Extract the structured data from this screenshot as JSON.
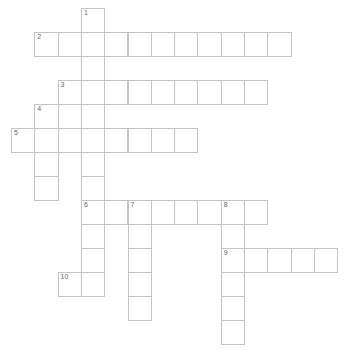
{
  "puzzle": {
    "cell_width": 23.3,
    "cell_height": 24,
    "origin_x": 11,
    "origin_y": 8,
    "colors": {
      "border": "#c4c4c4",
      "number": "#666666",
      "cell": "#ffffff"
    },
    "entries": [
      {
        "number": "1",
        "direction": "down",
        "row": 0,
        "col": 3,
        "length": 12
      },
      {
        "number": "2",
        "direction": "across",
        "row": 1,
        "col": 1,
        "length": 11
      },
      {
        "number": "3",
        "direction": "across",
        "row": 3,
        "col": 2,
        "length": 9
      },
      {
        "number": "4",
        "direction": "down",
        "row": 4,
        "col": 1,
        "length": 4
      },
      {
        "number": "5",
        "direction": "across",
        "row": 5,
        "col": 0,
        "length": 8
      },
      {
        "number": "6",
        "direction": "across",
        "row": 8,
        "col": 3,
        "length": 8
      },
      {
        "number": "7",
        "direction": "down",
        "row": 8,
        "col": 5,
        "length": 5
      },
      {
        "number": "8",
        "direction": "down",
        "row": 8,
        "col": 9,
        "length": 6
      },
      {
        "number": "9",
        "direction": "across",
        "row": 10,
        "col": 9,
        "length": 5
      },
      {
        "number": "10",
        "direction": "across",
        "row": 11,
        "col": 2,
        "length": 2
      }
    ]
  }
}
